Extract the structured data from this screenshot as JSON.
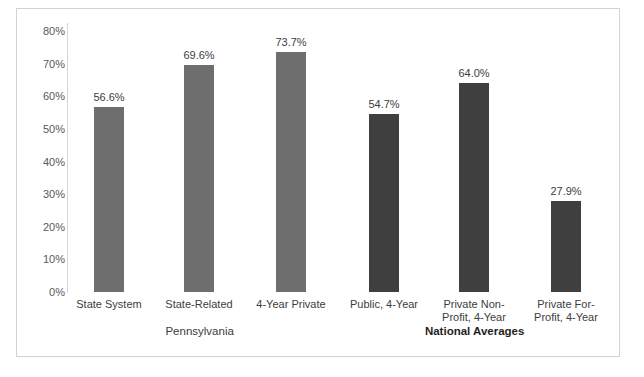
{
  "title": "",
  "chart_data": {
    "type": "bar",
    "title": "",
    "xlabel": "",
    "ylabel": "",
    "ylim": [
      0,
      80
    ],
    "ytick_labels": [
      "80%",
      "70%",
      "60%",
      "50%",
      "40%",
      "30%",
      "20%",
      "10%",
      "0%"
    ],
    "ytick_values": [
      80,
      70,
      60,
      50,
      40,
      30,
      20,
      10,
      0
    ],
    "grid": false,
    "legend": "none",
    "categories": [
      "State System",
      "State-Related",
      "4-Year Private",
      "Public, 4-Year",
      "Private Non-Profit, 4-Year",
      "Private For-Profit, 4-Year"
    ],
    "category_lines": [
      [
        "State System"
      ],
      [
        "State-Related"
      ],
      [
        "4-Year Private"
      ],
      [
        "Public, 4-Year"
      ],
      [
        "Private Non-",
        "Profit, 4-Year"
      ],
      [
        "Private For-",
        "Profit, 4-Year"
      ]
    ],
    "values": [
      56.6,
      69.6,
      73.7,
      54.7,
      64.0,
      27.9
    ],
    "value_labels": [
      "56.6%",
      "69.6%",
      "73.7%",
      "54.7%",
      "64.0%",
      "27.9%"
    ],
    "bar_colors": [
      "#6e6e6e",
      "#6e6e6e",
      "#6e6e6e",
      "#3f3f3f",
      "#3f3f3f",
      "#3f3f3f"
    ],
    "groups": [
      {
        "label": "Pennsylvania",
        "bold": false,
        "members": [
          0,
          1,
          2
        ]
      },
      {
        "label": "National Averages",
        "bold": true,
        "members": [
          3,
          4,
          5
        ]
      }
    ]
  },
  "colors": {
    "pennsylvania_bar": "#6e6e6e",
    "national_bar": "#3f3f3f",
    "frame_border": "#d2d2d2",
    "axis_line": "#d6d6d6",
    "tick_text": "#595959",
    "label_text": "#3d3d3d",
    "background": "#ffffff"
  }
}
